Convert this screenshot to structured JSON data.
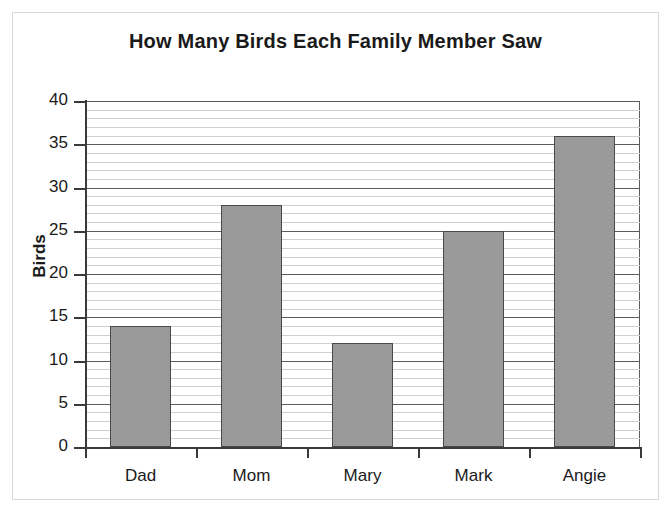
{
  "chart_data": {
    "type": "bar",
    "title": "How Many Birds Each Family Member Saw",
    "xlabel": "",
    "ylabel": "Birds",
    "categories": [
      "Dad",
      "Mom",
      "Mary",
      "Mark",
      "Angie"
    ],
    "values": [
      14,
      28,
      12,
      25,
      36
    ],
    "ylim": [
      0,
      40
    ],
    "y_major_step": 5,
    "y_minor_step": 1,
    "y_tick_labels": [
      "0",
      "5",
      "10",
      "15",
      "20",
      "25",
      "30",
      "35",
      "40"
    ],
    "grid": true,
    "grid_orientation": "horizontal",
    "legend": false,
    "bar_color": "#9a9a9a",
    "bar_border_color": "#4a4a4a",
    "axis_color": "#3a3a3a",
    "major_gridline_color": "#5c5c5c",
    "minor_gridline_color": "#cfcfcf",
    "background_color": "#ffffff",
    "frame_color": "#d8d8d8"
  }
}
